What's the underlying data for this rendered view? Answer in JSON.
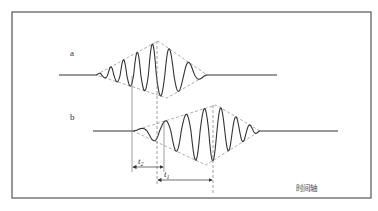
{
  "diagram": {
    "type": "wave-packet-time-delay",
    "frame": {
      "x1": 12,
      "y1": 12,
      "x2": 371,
      "y2": 198,
      "color": "#555555"
    },
    "colors": {
      "wave": "#333333",
      "envelope": "#999999",
      "guide": "#777777"
    },
    "waveforms": [
      {
        "label": "a",
        "label_pos": [
          71,
          55
        ],
        "baseline_y": 75,
        "flat_start": 59,
        "packet_start": 96,
        "packet_end": 207,
        "flat_end": 277,
        "envelope": {
          "left": [
            96,
            75
          ],
          "top": [
            158,
            41
          ],
          "right": [
            207,
            75
          ],
          "bottom": [
            167,
            98
          ]
        }
      },
      {
        "label": "b",
        "label_pos": [
          71,
          119
        ],
        "baseline_y": 131,
        "flat_start": 93,
        "packet_start": 133,
        "packet_end": 260,
        "flat_end": 338,
        "envelope": {
          "left": [
            133,
            131
          ],
          "top": [
            216,
            105
          ],
          "right": [
            260,
            131
          ],
          "bottom": [
            206,
            165
          ]
        }
      }
    ],
    "intervals": [
      {
        "label": "t",
        "sub": "2",
        "x_from": 132,
        "x_to": 164,
        "y": 167
      },
      {
        "label": "t",
        "sub": "1",
        "x_from": 157,
        "x_to": 213,
        "y": 180
      }
    ],
    "axis_label": "时间轴"
  }
}
